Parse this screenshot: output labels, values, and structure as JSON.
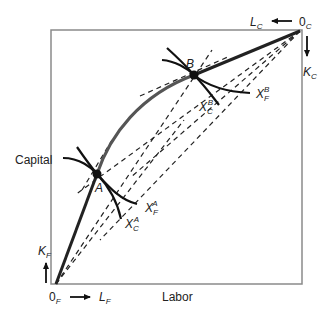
{
  "diagram": {
    "type": "edgeworth-box",
    "axis_labels": {
      "vertical": "Capital",
      "horizontal": "Labor"
    },
    "origins": {
      "food": {
        "label": "0",
        "sub": "F"
      },
      "clothing": {
        "label": "0",
        "sub": "C"
      }
    },
    "arrows": {
      "labor_food": {
        "label": "L",
        "sub": "F"
      },
      "capital_food": {
        "label": "K",
        "sub": "F"
      },
      "labor_clothing": {
        "label": "L",
        "sub": "C"
      },
      "capital_clothing": {
        "label": "K",
        "sub": "C"
      }
    },
    "points": [
      {
        "id": "A",
        "label": "A"
      },
      {
        "id": "B",
        "label": "B"
      }
    ],
    "isoquants": {
      "food_A": {
        "label": "X",
        "sub": "F",
        "sup": "A"
      },
      "clothing_A": {
        "label": "X",
        "sub": "C",
        "sup": "A"
      },
      "food_B": {
        "label": "X",
        "sub": "F",
        "sup": "B"
      },
      "clothing_B": {
        "label": "X",
        "sub": "C",
        "sup": "B"
      }
    },
    "colors": {
      "box": "#888888",
      "curve": "#555555",
      "ink": "#111111"
    }
  }
}
